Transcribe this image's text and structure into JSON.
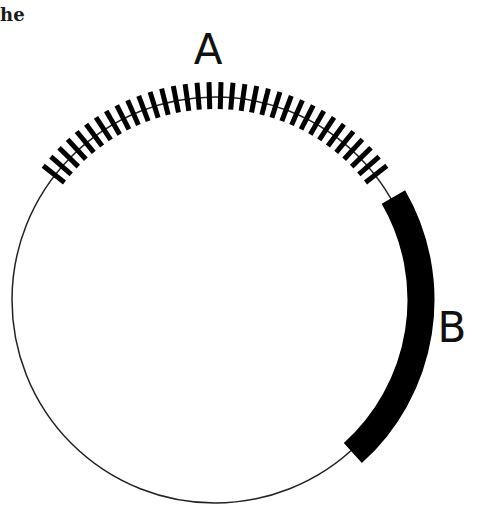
{
  "caption_fragment": "he",
  "diagram": {
    "type": "circular-map",
    "circle": {
      "cx": 215,
      "cy": 300,
      "r": 203,
      "stroke": "#222222",
      "stroke_width": 1.5
    },
    "regions": [
      {
        "id": "A",
        "label": "A",
        "style": "hatched",
        "start_angle_deg": 218,
        "end_angle_deg": 322,
        "tick_count": 34,
        "tick_inner_r": 191,
        "tick_outer_r": 218,
        "tick_width": 5,
        "label_x": 208,
        "label_y": 64
      },
      {
        "id": "B",
        "label": "B",
        "style": "solid-band",
        "start_angle_deg": -30,
        "end_angle_deg": 48,
        "band_r": 206,
        "band_width": 27,
        "label_x": 452,
        "label_y": 342
      }
    ],
    "color": "#000000"
  }
}
